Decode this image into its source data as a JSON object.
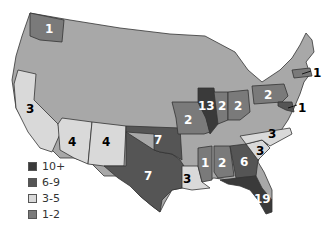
{
  "map": {
    "type": "choropleth",
    "region": "United States",
    "colors": {
      "base": "#a8a8a8",
      "c10plus": "#3a3a3a",
      "c6to9": "#555555",
      "c3to5": "#d9d9d9",
      "c1to2": "#7a7a7a"
    },
    "labels": [
      {
        "state": "Washington",
        "value": "1"
      },
      {
        "state": "California",
        "value": "3"
      },
      {
        "state": "Arizona",
        "value": "4"
      },
      {
        "state": "New Mexico",
        "value": "4"
      },
      {
        "state": "Texas",
        "value": "7"
      },
      {
        "state": "Oklahoma",
        "value": "7"
      },
      {
        "state": "Missouri",
        "value": "2"
      },
      {
        "state": "Illinois",
        "value": "13"
      },
      {
        "state": "Indiana",
        "value": "2"
      },
      {
        "state": "Ohio",
        "value": "2"
      },
      {
        "state": "Pennsylvania",
        "value": "2"
      },
      {
        "state": "Massachusetts",
        "value": "1"
      },
      {
        "state": "Maryland",
        "value": "1"
      },
      {
        "state": "Louisiana",
        "value": "3"
      },
      {
        "state": "Mississippi",
        "value": "1"
      },
      {
        "state": "Alabama",
        "value": "2"
      },
      {
        "state": "Georgia",
        "value": "6"
      },
      {
        "state": "Florida",
        "value": "19"
      },
      {
        "state": "South Carolina",
        "value": "3"
      },
      {
        "state": "North Carolina",
        "value": "3"
      }
    ]
  },
  "legend": {
    "items": [
      {
        "label": "10+",
        "color": "#3a3a3a"
      },
      {
        "label": "6-9",
        "color": "#555555"
      },
      {
        "label": "3-5",
        "color": "#d9d9d9"
      },
      {
        "label": "1-2",
        "color": "#7a7a7a"
      }
    ]
  }
}
